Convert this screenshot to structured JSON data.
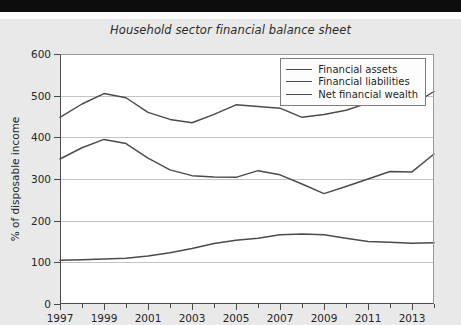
{
  "chart_data": {
    "type": "line",
    "title": "Household sector financial balance sheet",
    "xlabel": "",
    "ylabel": "% of disposable income",
    "ylim": [
      0,
      600
    ],
    "ytick_step": 100,
    "yticks": [
      0,
      100,
      200,
      300,
      400,
      500,
      600
    ],
    "xlim": [
      1997,
      2014
    ],
    "xticks": [
      1997,
      1998,
      1999,
      2000,
      2001,
      2002,
      2003,
      2004,
      2005,
      2006,
      2007,
      2008,
      2009,
      2010,
      2011,
      2012,
      2013,
      2014
    ],
    "xtick_labels": [
      "1997",
      "",
      "1999",
      "",
      "2001",
      "",
      "2003",
      "",
      "2005",
      "",
      "2007",
      "",
      "2009",
      "",
      "2011",
      "",
      "2013",
      ""
    ],
    "grid": true,
    "legend_position": "top-right",
    "x": [
      1997,
      1998,
      1999,
      2000,
      2001,
      2002,
      2003,
      2004,
      2005,
      2006,
      2007,
      2008,
      2009,
      2010,
      2011,
      2012,
      2013,
      2014
    ],
    "series": [
      {
        "name": "Financial assets",
        "color": "#4b4b4b",
        "values": [
          448,
          480,
          505,
          495,
          460,
          443,
          435,
          455,
          478,
          474,
          470,
          448,
          455,
          465,
          482,
          480,
          478,
          510
        ]
      },
      {
        "name": "Financial liabilities",
        "color": "#4b4b4b",
        "values": [
          348,
          375,
          395,
          385,
          350,
          322,
          308,
          305,
          304,
          320,
          310,
          288,
          265,
          282,
          300,
          318,
          317,
          360
        ]
      },
      {
        "name": "Net financial wealth",
        "color": "#4b4b4b",
        "values": [
          105,
          106,
          108,
          110,
          115,
          123,
          133,
          145,
          153,
          158,
          166,
          168,
          166,
          158,
          150,
          148,
          146,
          147
        ]
      }
    ]
  },
  "legend": {
    "items": [
      {
        "label": "Financial assets"
      },
      {
        "label": "Financial liabilities"
      },
      {
        "label": "Net financial wealth"
      }
    ]
  }
}
